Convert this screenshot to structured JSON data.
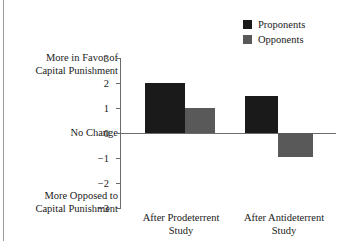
{
  "chart_data": {
    "type": "bar",
    "title": "",
    "subtitle": "",
    "xlabel": "",
    "ylabel": "",
    "categories": [
      "After Prodeterrent\nStudy",
      "After Antideterrent\nStudy"
    ],
    "category_lines": [
      [
        "After Prodeterrent",
        "Study"
      ],
      [
        "After Antideterrent",
        "Study"
      ]
    ],
    "series": [
      {
        "name": "Proponents",
        "color": "#1a1a1a",
        "values": [
          2.0,
          1.5
        ]
      },
      {
        "name": "Opponents",
        "color": "#595959",
        "values": [
          1.0,
          -0.95
        ]
      }
    ],
    "ylim": [
      -3,
      3
    ],
    "yticks": [
      3,
      2,
      1,
      0,
      -1,
      -2,
      -3
    ],
    "ytick_labels": [
      "3",
      "2",
      "1",
      "0",
      "−1",
      "−2",
      "−3"
    ],
    "grid": false,
    "legend_position": "top-right",
    "zero_reference_line": true,
    "axis_annotations": {
      "top": [
        "More in Favor of",
        "Capital Punishment"
      ],
      "zero": [
        "No Change"
      ],
      "bottom": [
        "More Opposed to",
        "Capital Punishment"
      ]
    }
  },
  "legend": {
    "items": [
      {
        "label": "Proponents",
        "color": "#1a1a1a"
      },
      {
        "label": "Opponents",
        "color": "#595959"
      }
    ]
  },
  "axis": {
    "y_top_label_line1": "More in Favor of",
    "y_top_label_line2": "Capital Punishment",
    "y_zero_label": "No Change",
    "y_bottom_label_line1": "More Opposed to",
    "y_bottom_label_line2": "Capital Punishment",
    "tick_3": "3",
    "tick_2": "2",
    "tick_1": "1",
    "tick_0": "0",
    "tick_m1": "−1",
    "tick_m2": "−2",
    "tick_m3": "−3"
  },
  "categories": {
    "group1_line1": "After Prodeterrent",
    "group1_line2": "Study",
    "group2_line1": "After Antideterrent",
    "group2_line2": "Study"
  },
  "colors": {
    "proponents": "#1a1a1a",
    "opponents": "#595959",
    "axis": "#6b6b6b",
    "page_rule": "#9a9a9a",
    "background": "#ffffff"
  }
}
